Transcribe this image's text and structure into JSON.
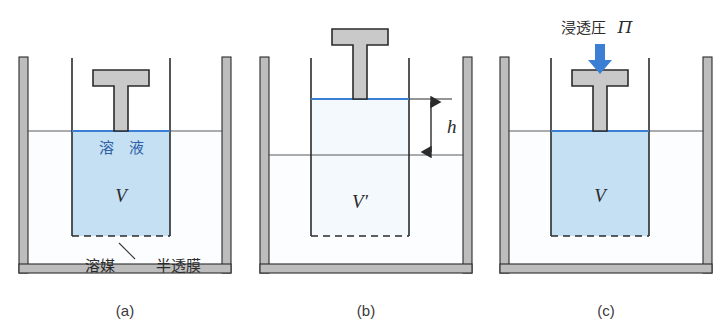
{
  "figure": {
    "title": "",
    "background_color": "#ffffff",
    "panel_count": 3
  },
  "colors": {
    "solution_fill": "#c5dff3",
    "solvent_fill": "#fafdff",
    "water_surface_line": "#3b7fd4",
    "arrow_blue": "#3b7fd4",
    "piston_fill": "#c9c9c9",
    "outline_dark": "#2b2b2b",
    "beaker_wall_fill": "#bdbdbd",
    "label_blue": "#2c5fa8",
    "label_dark": "#2b2b2b"
  },
  "panels": [
    {
      "id": "a",
      "caption": "(a)",
      "labels": {
        "solution": "溶　液",
        "volume": "V",
        "solvent": "溶媒",
        "membrane": "半透膜"
      },
      "state": "equilibrium-start",
      "tube_liquid": "solution",
      "piston_position": "at-liquid-surface",
      "has_membrane": true,
      "outer_level_equals_inner": true
    },
    {
      "id": "b",
      "caption": "(b)",
      "labels": {
        "volume": "V′",
        "height": "h"
      },
      "state": "osmosis-risen",
      "tube_liquid": "diluted-solution",
      "piston_position": "raised",
      "has_membrane": true,
      "outer_level_equals_inner": false,
      "height_difference_label": "h"
    },
    {
      "id": "c",
      "caption": "(c)",
      "labels": {
        "osmotic_pressure": "浸透圧",
        "osmotic_pressure_symbol": "Π",
        "volume": "V"
      },
      "state": "pressure-applied",
      "tube_liquid": "solution",
      "piston_position": "pressed-to-original-level",
      "has_membrane": true,
      "outer_level_equals_inner": true,
      "arrow": {
        "name": "pressure-arrow",
        "direction": "down",
        "color": "#3b7fd4"
      }
    }
  ]
}
